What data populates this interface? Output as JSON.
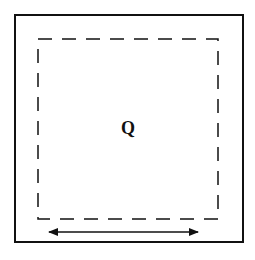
{
  "diagram": {
    "center_label": "Q",
    "outer_box": {
      "x": 15,
      "y": 15,
      "width": 228,
      "height": 227,
      "stroke": "#111111"
    },
    "inner_dashed_box": {
      "x": 38,
      "y": 39,
      "width": 180,
      "height": 180,
      "stroke": "#111111",
      "dash": "14,10"
    },
    "arrow": {
      "x1": 47,
      "x2": 200,
      "y": 232,
      "type": "double-headed",
      "color": "#111111"
    }
  }
}
